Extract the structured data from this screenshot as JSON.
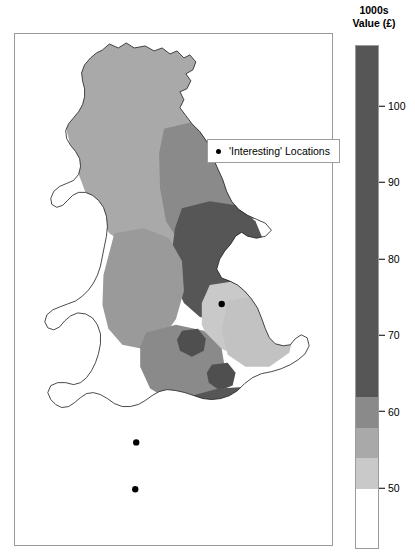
{
  "map": {
    "title": "",
    "region": "United Kingdom",
    "frame": {
      "x": 14,
      "y": 33,
      "width": 319,
      "height": 513
    },
    "point_legend": {
      "marker": "dot-marker",
      "label": "'Interesting' Locations"
    },
    "points": [
      {
        "name": "point-the-wash",
        "x": 222,
        "y": 304
      },
      {
        "name": "point-south-wales",
        "x": 136,
        "y": 443
      },
      {
        "name": "point-devon",
        "x": 135,
        "y": 490
      }
    ]
  },
  "colorbar": {
    "title_line1": "1000s",
    "title_line2": "Value (£)",
    "orientation": "vertical",
    "min": 42,
    "max": 108,
    "ticks": [
      {
        "value": 100,
        "label": "100"
      },
      {
        "value": 90,
        "label": "90"
      },
      {
        "value": 80,
        "label": "80"
      },
      {
        "value": 70,
        "label": "70"
      },
      {
        "value": 60,
        "label": "60"
      },
      {
        "value": 50,
        "label": "50"
      }
    ],
    "bands": [
      {
        "from": 62,
        "to": 108,
        "color": "#565656",
        "label": "62-108"
      },
      {
        "from": 58,
        "to": 62,
        "color": "#8a8a8a",
        "label": "58-62"
      },
      {
        "from": 54,
        "to": 58,
        "color": "#a9a9a9",
        "label": "54-58"
      },
      {
        "from": 50,
        "to": 54,
        "color": "#c9c9c9",
        "label": "50-54"
      },
      {
        "from": 42,
        "to": 50,
        "color": "#ffffff",
        "label": "42-50"
      }
    ]
  },
  "chart_data": {
    "type": "heatmap",
    "xlabel": "",
    "ylabel": "",
    "legend_position": "right",
    "unit": "1000s Value (£)",
    "levels": [
      50,
      54,
      58,
      62,
      70,
      80,
      90,
      100
    ],
    "level_colors": [
      "#ffffff",
      "#c9c9c9",
      "#a9a9a9",
      "#8a8a8a",
      "#565656"
    ],
    "regions": [
      {
        "region": "Northern Scotland",
        "value_band": "54-58",
        "color": "#a9a9a9"
      },
      {
        "region": "Eastern Scotland",
        "value_band": "58-62",
        "color": "#8a8a8a"
      },
      {
        "region": "North East England",
        "value_band": "62-108",
        "color": "#565656"
      },
      {
        "region": "North West England",
        "value_band": "54-62",
        "color": "#9a9a9a"
      },
      {
        "region": "Yorkshire / Humber",
        "value_band": "50-54",
        "color": "#c9c9c9"
      },
      {
        "region": "Midlands",
        "value_band": "58-62",
        "color": "#8a8a8a"
      },
      {
        "region": "Wales",
        "value_band": "42-50",
        "color": "#ffffff"
      },
      {
        "region": "South West / Cornwall",
        "value_band": "42-50",
        "color": "#ffffff"
      },
      {
        "region": "South East England",
        "value_band": "62-108",
        "color": "#565656"
      },
      {
        "region": "East Anglia",
        "value_band": "50-58",
        "color": "#bdbdbd"
      }
    ],
    "point_series": {
      "name": "'Interesting' Locations",
      "marker": "dot",
      "count": 3
    }
  }
}
